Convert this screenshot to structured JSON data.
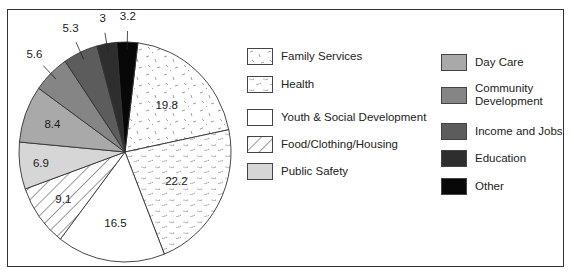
{
  "chart_data": {
    "type": "pie",
    "title": "",
    "unit": "percent",
    "start_angle_deg_clockwise_from_top": 7,
    "direction": "clockwise",
    "slices": [
      {
        "name": "Family Services",
        "value": 19.8,
        "label": "19.8",
        "fill": "#ffffff",
        "pattern": "dashes",
        "label_position": "inside"
      },
      {
        "name": "Health",
        "value": 22.2,
        "label": "22.2",
        "fill": "#ffffff",
        "pattern": "dots",
        "label_position": "inside"
      },
      {
        "name": "Youth & Social Development",
        "value": 16.5,
        "label": "16.5",
        "fill": "#ffffff",
        "pattern": "none",
        "label_position": "inside"
      },
      {
        "name": "Food/Clothing/Housing",
        "value": 9.1,
        "label": "9.1",
        "fill": "#ffffff",
        "pattern": "hatch",
        "label_position": "inside"
      },
      {
        "name": "Public Safety",
        "value": 6.9,
        "label": "6.9",
        "fill": "#d6d6d6",
        "pattern": "none",
        "label_position": "inside"
      },
      {
        "name": "Day Care",
        "value": 8.4,
        "label": "8.4",
        "fill": "#a9a9a9",
        "pattern": "none",
        "label_position": "inside"
      },
      {
        "name": "Community Development",
        "value": 5.6,
        "label": "5.6",
        "fill": "#858585",
        "pattern": "none",
        "label_position": "outside"
      },
      {
        "name": "Income and Jobs",
        "value": 5.3,
        "label": "5.3",
        "fill": "#5c5c5c",
        "pattern": "none",
        "label_position": "outside"
      },
      {
        "name": "Education",
        "value": 3,
        "label": "3",
        "fill": "#2e2e2e",
        "pattern": "none",
        "label_position": "outside"
      },
      {
        "name": "Other",
        "value": 3.2,
        "label": "3.2",
        "fill": "#080808",
        "pattern": "none",
        "label_position": "outside"
      }
    ],
    "legend": {
      "placement": "right",
      "columns": [
        [
          "Family Services",
          "Health",
          "Youth & Social Development",
          "Food/Clothing/Housing",
          "Public Safety"
        ],
        [
          "Day Care",
          "Community Development",
          "Income and Jobs",
          "Education",
          "Other"
        ]
      ]
    }
  },
  "legend_labels": {
    "family_services": "Family Services",
    "health": "Health",
    "youth": "Youth & Social Development",
    "food": "Food/Clothing/Housing",
    "public_safety": "Public Safety",
    "day_care": "Day Care",
    "community_line1": "Community",
    "community_line2": "Development",
    "income": "Income and Jobs",
    "education": "Education",
    "other": "Other"
  }
}
